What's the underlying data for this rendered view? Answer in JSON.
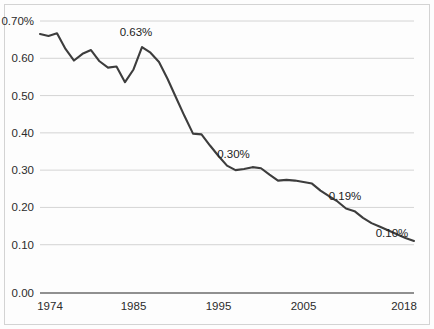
{
  "chart_data": {
    "type": "line",
    "title": "",
    "subtitle": "",
    "xlabel": "",
    "ylabel": "",
    "xlim": [
      1974,
      2018
    ],
    "ylim": [
      0.0,
      0.7
    ],
    "grid": true,
    "legend": "none",
    "y_tick_labels": [
      "0.70%",
      "0.60",
      "0.50",
      "0.40",
      "0.30",
      "0.20",
      "0.10",
      "0.00"
    ],
    "y_tick_values": [
      0.7,
      0.6,
      0.5,
      0.4,
      0.3,
      0.2,
      0.1,
      0.0
    ],
    "x_tick_labels": [
      "1974",
      "1985",
      "1995",
      "2005",
      "2018"
    ],
    "x_tick_values": [
      1974,
      1985,
      1995,
      2005,
      2018
    ],
    "series": [
      {
        "name": "value",
        "x": [
          1974,
          1975,
          1976,
          1977,
          1978,
          1979,
          1980,
          1981,
          1982,
          1983,
          1984,
          1985,
          1986,
          1987,
          1988,
          1989,
          1990,
          1991,
          1992,
          1993,
          1994,
          1995,
          1996,
          1997,
          1998,
          1999,
          2000,
          2001,
          2002,
          2003,
          2004,
          2005,
          2006,
          2007,
          2008,
          2009,
          2010,
          2011,
          2012,
          2013,
          2014,
          2015,
          2016,
          2017,
          2018
        ],
        "values": [
          0.665,
          0.66,
          0.667,
          0.625,
          0.594,
          0.612,
          0.622,
          0.592,
          0.575,
          0.578,
          0.536,
          0.57,
          0.63,
          0.615,
          0.59,
          0.545,
          0.495,
          0.445,
          0.398,
          0.396,
          0.366,
          0.338,
          0.312,
          0.3,
          0.303,
          0.308,
          0.305,
          0.288,
          0.272,
          0.274,
          0.272,
          0.268,
          0.264,
          0.245,
          0.23,
          0.216,
          0.197,
          0.19,
          0.172,
          0.158,
          0.148,
          0.138,
          0.128,
          0.118,
          0.11
        ]
      }
    ],
    "annotations": [
      {
        "label": "0.63%",
        "x": 1986,
        "y": 0.63
      },
      {
        "label": "0.30%",
        "x": 1997,
        "y": 0.3
      },
      {
        "label": "0.19%",
        "x": 2010,
        "y": 0.19
      },
      {
        "label": "0.10%",
        "x": 2018,
        "y": 0.1
      }
    ],
    "colors": {
      "line": "#3d3d3d",
      "grid": "#c9c9c9",
      "axis": "#6b6b6b",
      "text": "#2b2b2b",
      "background": "#fdfdfd"
    }
  }
}
